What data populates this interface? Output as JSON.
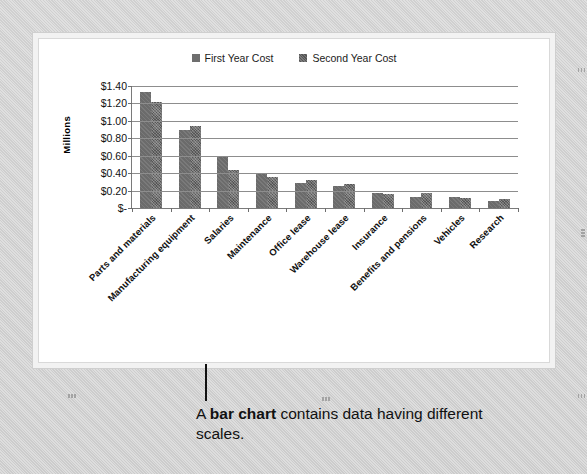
{
  "caption": {
    "prefix": "A ",
    "emphasis": "bar chart",
    "suffix": " contains data having different scales."
  },
  "frame": {
    "handles": [
      "top-left",
      "top-middle",
      "top-right",
      "left-middle",
      "right-middle",
      "bottom-left",
      "bottom-middle",
      "bottom-right"
    ]
  },
  "chart_data": {
    "type": "bar",
    "title": "",
    "xlabel": "",
    "ylabel": "Millions",
    "ylim": [
      0,
      1.4
    ],
    "ytick_labels": [
      "$1.40",
      "$1.20",
      "$1.00",
      "$0.80",
      "$0.60",
      "$0.40",
      "$0.20",
      "$-"
    ],
    "ytick_values": [
      1.4,
      1.2,
      1.0,
      0.8,
      0.6,
      0.4,
      0.2,
      0.0
    ],
    "grid": true,
    "legend_position": "top-center",
    "categories": [
      "Parts and materials",
      "Manufacturing equipment",
      "Salaries",
      "Maintenance",
      "Office lease",
      "Warehouse lease",
      "Insurance",
      "Benefits and pensions",
      "Vehicles",
      "Research"
    ],
    "series": [
      {
        "name": "First Year Cost",
        "color": "#6b6b6b",
        "values": [
          1.33,
          0.9,
          0.58,
          0.4,
          0.29,
          0.25,
          0.17,
          0.13,
          0.125,
          0.075
        ]
      },
      {
        "name": "Second Year Cost",
        "color": "#565656",
        "values": [
          1.22,
          0.94,
          0.44,
          0.36,
          0.32,
          0.27,
          0.165,
          0.17,
          0.115,
          0.1
        ]
      }
    ]
  }
}
